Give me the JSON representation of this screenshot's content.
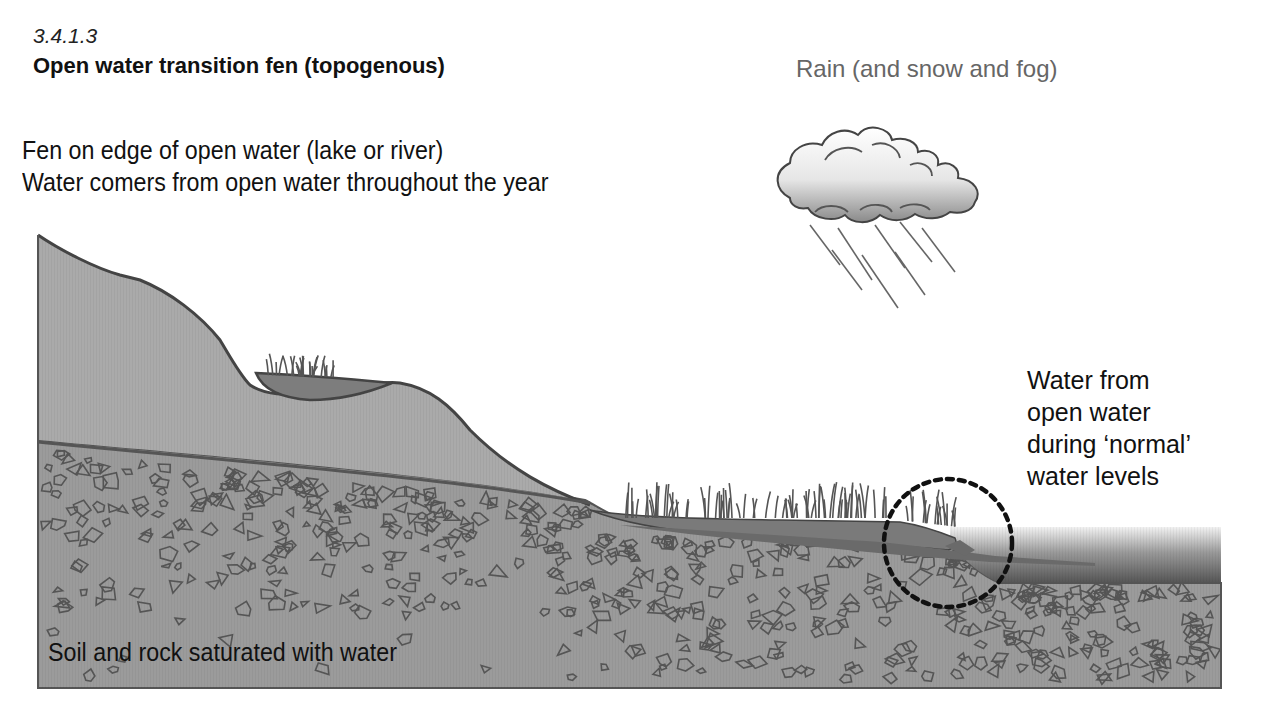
{
  "header": {
    "section_number": "3.4.1.3",
    "title": "Open water transition fen (topogenous)"
  },
  "description": {
    "line1": "Fen on edge of open water (lake or river)",
    "line2": "Water comers from open water throughout the year"
  },
  "labels": {
    "rain": "Rain (and snow and fog)",
    "water_source": [
      "Water from",
      "open water",
      "during ‘normal’",
      "water levels"
    ],
    "soil": "Soil and rock saturated with water"
  },
  "icons": {
    "weather": "rain-cloud-icon",
    "highlight": "dotted-circle-marker",
    "vegetation": "grass-tufts"
  },
  "colors": {
    "hill": "#a6a6a6",
    "soil": "#9a9a9a",
    "peat": "#7c7c7c",
    "outline": "#444444",
    "water_top": "#eeeeee",
    "water_bottom": "#555555",
    "rain_label": "#666666",
    "marker": "#111111"
  }
}
